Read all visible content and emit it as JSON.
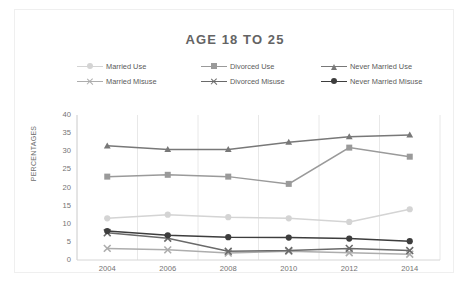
{
  "chart": {
    "title": "AGE 18 TO 25",
    "ylabel": "PERCENTAGES"
  },
  "legend": {
    "rows": [
      [
        {
          "label": "Married Use",
          "marker": "circle",
          "color": "#d4d4d4"
        },
        {
          "label": "Divorced Use",
          "marker": "square",
          "color": "#9a9a9a"
        },
        {
          "label": "Never Married Use",
          "marker": "triangle",
          "color": "#787878"
        }
      ],
      [
        {
          "label": "Married Misuse",
          "marker": "x",
          "color": "#adadad"
        },
        {
          "label": "Divorced Misuse",
          "marker": "x",
          "color": "#6a6a6a"
        },
        {
          "label": "Never Married Misuse",
          "marker": "circle",
          "color": "#3d3d3d"
        }
      ]
    ]
  },
  "chart_data": {
    "type": "line",
    "title": "AGE 18 TO 25",
    "xlabel": "",
    "ylabel": "PERCENTAGES",
    "categories": [
      "2004",
      "2006",
      "2008",
      "2010",
      "2012",
      "2014"
    ],
    "x": [
      2004,
      2006,
      2008,
      2010,
      2012,
      2014
    ],
    "ylim": [
      0,
      40
    ],
    "yticks": [
      0,
      5,
      10,
      15,
      20,
      25,
      30,
      35,
      40
    ],
    "grid": "vertical",
    "legend_position": "top",
    "series": [
      {
        "name": "Married Use",
        "marker": "circle",
        "color": "#d4d4d4",
        "values": [
          11.5,
          12.5,
          11.8,
          11.5,
          10.5,
          14.0
        ]
      },
      {
        "name": "Divorced Use",
        "marker": "square",
        "color": "#9a9a9a",
        "values": [
          23.0,
          23.5,
          23.0,
          21.0,
          31.0,
          28.5
        ]
      },
      {
        "name": "Never Married Use",
        "marker": "triangle",
        "color": "#787878",
        "values": [
          31.5,
          30.5,
          30.5,
          32.5,
          34.0,
          34.5
        ]
      },
      {
        "name": "Married Misuse",
        "marker": "x",
        "color": "#adadad",
        "values": [
          3.2,
          2.8,
          1.9,
          2.4,
          2.0,
          1.6
        ]
      },
      {
        "name": "Divorced Misuse",
        "marker": "x",
        "color": "#6a6a6a",
        "values": [
          7.5,
          6.0,
          2.4,
          2.6,
          3.2,
          2.6
        ]
      },
      {
        "name": "Never Married Misuse",
        "marker": "circle",
        "color": "#3d3d3d",
        "values": [
          8.0,
          6.8,
          6.3,
          6.2,
          5.9,
          5.2
        ]
      }
    ]
  }
}
